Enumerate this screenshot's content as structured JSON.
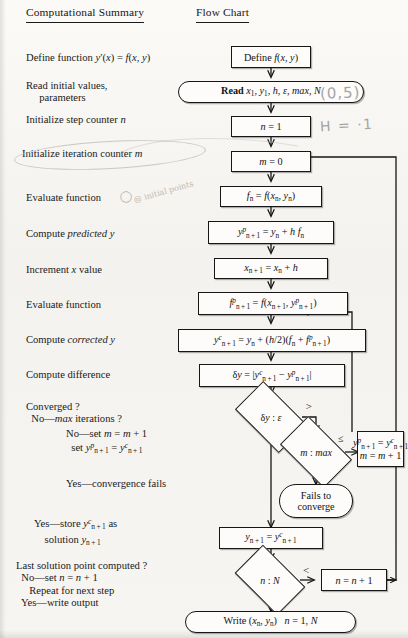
{
  "headings": {
    "left": "Computational Summary",
    "right": "Flow Chart"
  },
  "summary_steps": [
    {
      "id": "define",
      "lines": [
        "Define function y′(x) = f(x, y)"
      ]
    },
    {
      "id": "read",
      "lines": [
        "Read initial values,",
        "        parameters"
      ]
    },
    {
      "id": "init-n",
      "lines": [
        "Initialize step counter n"
      ]
    },
    {
      "id": "init-m",
      "lines": [
        "Initialize iteration counter m"
      ]
    },
    {
      "id": "eval-f",
      "lines": [
        "Evaluate function"
      ]
    },
    {
      "id": "predict",
      "lines": [
        "Compute predicted y"
      ]
    },
    {
      "id": "incr-x",
      "lines": [
        "Increment x value"
      ]
    },
    {
      "id": "eval-fp",
      "lines": [
        "Evaluate function"
      ]
    },
    {
      "id": "correct",
      "lines": [
        "Compute corrected y"
      ]
    },
    {
      "id": "diff",
      "lines": [
        "Compute difference"
      ]
    },
    {
      "id": "converged",
      "lines": [
        "Converged ?",
        "   No—max iterations ?"
      ]
    },
    {
      "id": "no-set",
      "lines": [
        "No—set m = m + 1",
        "  set yᵖₙ₊₁ = yᶜₙ₊₁"
      ]
    },
    {
      "id": "yes-fails",
      "lines": [
        "Yes—convergence fails"
      ]
    },
    {
      "id": "yes-store",
      "lines": [
        "Yes—store yᶜₙ₊₁ as",
        "    solution yₙ₊₁"
      ]
    },
    {
      "id": "last-point",
      "lines": [
        "Last solution point computed ?",
        "  No—set n = n + 1",
        "     Repeat for next step",
        "  Yes—write output"
      ]
    }
  ],
  "flow_nodes": [
    {
      "id": "define",
      "shape": "rect",
      "label": "Define f(x, y)"
    },
    {
      "id": "read",
      "shape": "terminal",
      "label": "Read x₁, y₁, h, ε, max, N"
    },
    {
      "id": "set-n",
      "shape": "rect",
      "label": "n = 1"
    },
    {
      "id": "set-m",
      "shape": "rect",
      "label": "m = 0"
    },
    {
      "id": "fn",
      "shape": "rect",
      "label": "fₙ = f(xₙ, yₙ)"
    },
    {
      "id": "ypred",
      "shape": "rect",
      "label": "yᵖₙ₊₁ = yₙ + h fₙ"
    },
    {
      "id": "xnext",
      "shape": "rect",
      "label": "xₙ₊₁ = xₙ + h"
    },
    {
      "id": "fpred",
      "shape": "rect",
      "label": "fᵖₙ₊₁ = f(xₙ₊₁, yᵖₙ₊₁)"
    },
    {
      "id": "ycorr",
      "shape": "rect",
      "label": "yᶜₙ₊₁ = yₙ + (h/2)(fₙ + fᵖₙ₊₁)"
    },
    {
      "id": "delta",
      "shape": "rect",
      "label": "δy = |yᶜₙ₊₁ − yᵖₙ₊₁|"
    },
    {
      "id": "dy-eps",
      "shape": "diamond",
      "label": "δy : ε"
    },
    {
      "id": "m-max",
      "shape": "diamond",
      "label": "m : max"
    },
    {
      "id": "update",
      "shape": "rect",
      "label": "yᵖₙ₊₁ = yᶜₙ₊₁ / m = m + 1"
    },
    {
      "id": "fails",
      "shape": "terminal",
      "label": "Fails to converge"
    },
    {
      "id": "store",
      "shape": "rect",
      "label": "yₙ₊₁ = yᶜₙ₊₁"
    },
    {
      "id": "n-N",
      "shape": "diamond",
      "label": "n : N"
    },
    {
      "id": "incr-n",
      "shape": "rect",
      "label": "n = n + 1"
    },
    {
      "id": "write",
      "shape": "terminal",
      "label": "Write (xₙ, yₙ)   n = 1, N"
    }
  ],
  "edge_labels": {
    "gt": ">",
    "le": "≤",
    "lt": "<"
  },
  "annotations": [
    {
      "id": "initial-condition",
      "text": "(0,5)"
    },
    {
      "id": "step-size",
      "text": "H = ·1"
    },
    {
      "id": "eval-note",
      "text": "@ initial points"
    }
  ],
  "colors": {
    "ink": "#161616",
    "paper": "#f6f4f0",
    "pencil": "#9a9a9a"
  }
}
